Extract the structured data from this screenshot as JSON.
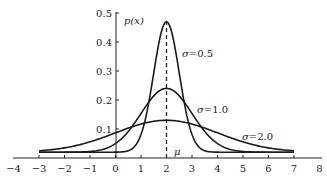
{
  "chart_data": {
    "type": "line",
    "title": "",
    "xlabel": "",
    "ylabel": "p(x)",
    "xlim": [
      -4,
      8
    ],
    "ylim": [
      0,
      0.5
    ],
    "grid": false,
    "legend": "inline annotations",
    "x_ticks": [
      "−4",
      "−3",
      "−2",
      "−1",
      "0",
      "1",
      "2",
      "3",
      "4",
      "5",
      "6",
      "7",
      "8"
    ],
    "y_ticks": [
      "0.1",
      "0.2",
      "0.3",
      "0.4",
      "0.5"
    ],
    "mean": 2,
    "mean_label": "μ",
    "x_range_plotted": [
      -3,
      7
    ],
    "series": [
      {
        "name": "σ=0.5",
        "sigma": 0.5,
        "peak": 0.47,
        "label_parts": [
          "σ",
          "=0.5"
        ]
      },
      {
        "name": "σ=1.0",
        "sigma": 1.0,
        "peak": 0.24,
        "label_parts": [
          "σ",
          "=1.0"
        ]
      },
      {
        "name": "σ=2.0",
        "sigma": 2.0,
        "peak": 0.13,
        "label_parts": [
          "σ",
          "=2.0"
        ]
      }
    ],
    "annotations": [
      {
        "text": "σ=0.5",
        "x": 2.6,
        "y": 0.36
      },
      {
        "text": "σ=1.0",
        "x": 3.6,
        "y": 0.19
      },
      {
        "text": "σ=2.0",
        "x": 5.1,
        "y": 0.08
      },
      {
        "text": "μ",
        "x": 2.3,
        "y": 0.01
      },
      {
        "text": "p(x)",
        "x": 0.3,
        "y": 0.47
      }
    ]
  },
  "labels": {
    "ylabel": "p(x)",
    "mu": "μ",
    "s05_sym": "σ",
    "s05_val": "=0.5",
    "s10_sym": "σ",
    "s10_val": "=1.0",
    "s20_sym": "σ",
    "s20_val": "=2.0"
  }
}
